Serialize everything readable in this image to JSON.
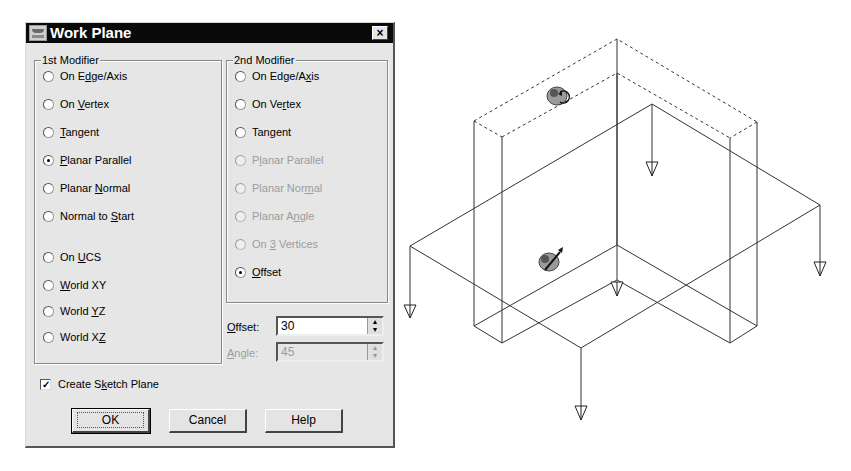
{
  "dialog": {
    "title": "Work Plane",
    "close_label": "×",
    "first_modifier": {
      "label": "1st Modifier",
      "options": [
        {
          "pre": "On E",
          "u": "d",
          "post": "ge/Axis",
          "selected": false,
          "enabled": true
        },
        {
          "pre": "On ",
          "u": "V",
          "post": "ertex",
          "selected": false,
          "enabled": true
        },
        {
          "pre": "",
          "u": "T",
          "post": "angent",
          "selected": false,
          "enabled": true
        },
        {
          "pre": "",
          "u": "P",
          "post": "lanar Parallel",
          "selected": true,
          "enabled": true
        },
        {
          "pre": "Planar ",
          "u": "N",
          "post": "ormal",
          "selected": false,
          "enabled": true
        },
        {
          "pre": "Normal to ",
          "u": "S",
          "post": "tart",
          "selected": false,
          "enabled": true
        },
        {
          "pre": "On ",
          "u": "U",
          "post": "CS",
          "selected": false,
          "enabled": true
        },
        {
          "pre": "",
          "u": "W",
          "post": "orld XY",
          "selected": false,
          "enabled": true
        },
        {
          "pre": "World ",
          "u": "Y",
          "post": "Z",
          "selected": false,
          "enabled": true
        },
        {
          "pre": "World X",
          "u": "Z",
          "post": "",
          "selected": false,
          "enabled": true
        }
      ]
    },
    "second_modifier": {
      "label": "2nd Modifier",
      "options": [
        {
          "pre": "On Edge/A",
          "u": "x",
          "post": "is",
          "selected": false,
          "enabled": true
        },
        {
          "pre": "On Ve",
          "u": "r",
          "post": "tex",
          "selected": false,
          "enabled": true
        },
        {
          "pre": "Tan",
          "u": "g",
          "post": "ent",
          "selected": false,
          "enabled": true
        },
        {
          "pre": "P",
          "u": "l",
          "post": "anar Parallel",
          "selected": false,
          "enabled": false
        },
        {
          "pre": "Planar Nor",
          "u": "m",
          "post": "al",
          "selected": false,
          "enabled": false
        },
        {
          "pre": "Planar A",
          "u": "n",
          "post": "gle",
          "selected": false,
          "enabled": false
        },
        {
          "pre": "On ",
          "u": "3",
          "post": " Vertices",
          "selected": false,
          "enabled": false
        },
        {
          "pre": "",
          "u": "O",
          "post": "ffset",
          "selected": true,
          "enabled": true
        }
      ]
    },
    "offset": {
      "label_u": "O",
      "label_rest": "ffset:",
      "value": "30",
      "enabled": true
    },
    "angle": {
      "label_u": "A",
      "label_rest": "ngle:",
      "value": "45",
      "enabled": false
    },
    "spin_up": "▲",
    "spin_down": "▼",
    "create_sketch_plane": {
      "pre": "Create S",
      "u": "k",
      "post": "etch Plane",
      "checked": true,
      "check_glyph": "✓"
    },
    "buttons": {
      "ok": "OK",
      "cancel": "Cancel",
      "help": "Help"
    }
  },
  "viewport": {
    "description": "Isometric wireframe of L-shaped part with offset work plane",
    "icons": [
      "rotate-handle-icon",
      "offset-handle-icon"
    ],
    "direction_markers": 6
  }
}
